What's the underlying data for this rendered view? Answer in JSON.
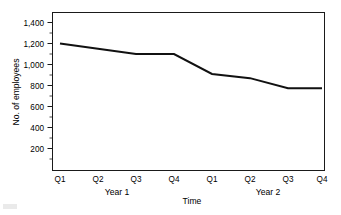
{
  "chart_data": {
    "type": "line",
    "title": "",
    "xlabel": "Time",
    "ylabel": "No. of employees",
    "categories": [
      "Q1",
      "Q2",
      "Q3",
      "Q4",
      "Q1",
      "Q2",
      "Q3",
      "Q4"
    ],
    "group_labels": [
      "Year 1",
      "Year 2"
    ],
    "values": [
      1200,
      1150,
      1100,
      1100,
      910,
      870,
      775,
      775
    ],
    "series": [
      {
        "name": "No. of employees",
        "values": [
          1200,
          1150,
          1100,
          1100,
          910,
          870,
          775,
          775
        ]
      }
    ],
    "ytick_labels": [
      "1,400",
      "1,200",
      "1,000",
      "800",
      "600",
      "400",
      "200"
    ],
    "ytick_values": [
      1400,
      1200,
      1000,
      800,
      600,
      400,
      200
    ],
    "ylim": [
      100,
      1500
    ],
    "grid": false,
    "legend": "none",
    "line_color": "#111111"
  },
  "axes": {
    "y_title": "No. of employees",
    "x_title": "Time",
    "y_ticks": [
      {
        "label": "1,400"
      },
      {
        "label": "1,200"
      },
      {
        "label": "1,000"
      },
      {
        "label": "800"
      },
      {
        "label": "600"
      },
      {
        "label": "400"
      },
      {
        "label": "200"
      }
    ],
    "x_ticks": [
      {
        "label": "Q1"
      },
      {
        "label": "Q2"
      },
      {
        "label": "Q3"
      },
      {
        "label": "Q4"
      },
      {
        "label": "Q1"
      },
      {
        "label": "Q2"
      },
      {
        "label": "Q3"
      },
      {
        "label": "Q4"
      }
    ],
    "groups": [
      {
        "label": "Year 1"
      },
      {
        "label": "Year 2"
      }
    ]
  }
}
